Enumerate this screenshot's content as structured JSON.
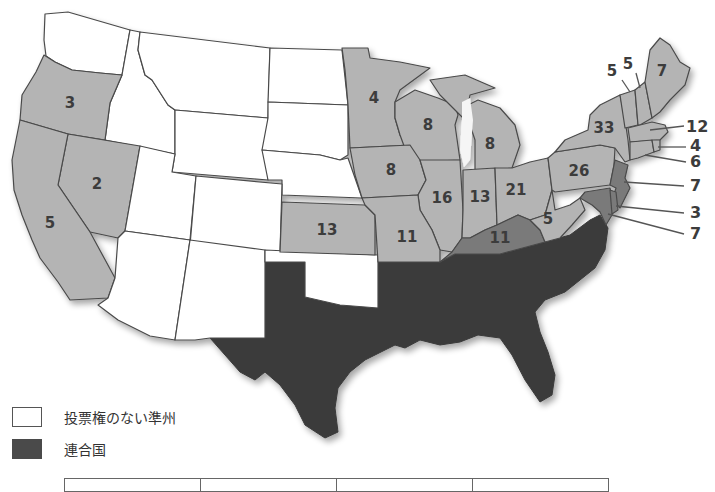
{
  "map": {
    "colors": {
      "union": "#b4b4b4",
      "border_state": "#7a7a7a",
      "territory": "#ffffff",
      "confederacy": "#3a3a3a"
    },
    "state_labels": [
      {
        "state": "Oregon",
        "value": "3"
      },
      {
        "state": "California",
        "value": "5"
      },
      {
        "state": "Nevada",
        "value": "2"
      },
      {
        "state": "Minnesota",
        "value": "4"
      },
      {
        "state": "Wisconsin",
        "value": "8"
      },
      {
        "state": "Michigan",
        "value": "8"
      },
      {
        "state": "Iowa",
        "value": "8"
      },
      {
        "state": "Kansas",
        "value": "13"
      },
      {
        "state": "Missouri",
        "value": "11"
      },
      {
        "state": "Illinois",
        "value": "16"
      },
      {
        "state": "Indiana",
        "value": "13"
      },
      {
        "state": "Ohio",
        "value": "21"
      },
      {
        "state": "Kentucky",
        "value": "11"
      },
      {
        "state": "West Virginia",
        "value": "5"
      },
      {
        "state": "Pennsylvania",
        "value": "26"
      },
      {
        "state": "New York",
        "value": "33"
      },
      {
        "state": "Vermont",
        "value": "5"
      },
      {
        "state": "New Hampshire",
        "value": "5"
      },
      {
        "state": "Maine",
        "value": "7"
      }
    ],
    "callout_labels": [
      {
        "state": "Massachusetts",
        "value": "12"
      },
      {
        "state": "Rhode Island",
        "value": "4"
      },
      {
        "state": "Connecticut",
        "value": "6"
      },
      {
        "state": "New Jersey",
        "value": "7"
      },
      {
        "state": "Delaware",
        "value": "3"
      },
      {
        "state": "Maryland",
        "value": "7"
      }
    ]
  },
  "legend": {
    "items": [
      {
        "label": "投票権のない準州",
        "swatch": "white"
      },
      {
        "label": "連合国",
        "swatch": "dark"
      }
    ]
  },
  "table": {
    "columns": [
      "",
      "",
      "",
      ""
    ]
  }
}
